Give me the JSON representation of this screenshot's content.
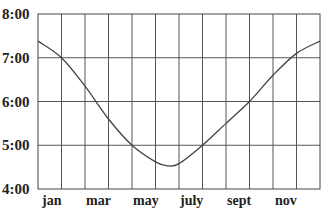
{
  "chart_data": {
    "type": "line",
    "title": "",
    "xlabel": "",
    "ylabel": "",
    "x_tick_labels": [
      "jan",
      "mar",
      "may",
      "july",
      "sept",
      "nov"
    ],
    "y_tick_labels": [
      "4:00",
      "5:00",
      "6:00",
      "7:00",
      "8:00"
    ],
    "ylim": [
      4.0,
      8.0
    ],
    "xlim": [
      0,
      12
    ],
    "grid": true,
    "legend": null,
    "series": [
      {
        "name": "time",
        "x": [
          0,
          1,
          2,
          3,
          4,
          5,
          5.5,
          6,
          7,
          8,
          9,
          10,
          11,
          12
        ],
        "y": [
          7.38,
          7.0,
          6.35,
          5.6,
          5.0,
          4.62,
          4.53,
          4.58,
          5.0,
          5.5,
          6.0,
          6.6,
          7.1,
          7.38
        ]
      }
    ]
  },
  "axis": {
    "y_labels": [
      "8:00",
      "7:00",
      "6:00",
      "5:00",
      "4:00"
    ],
    "x_labels": [
      "jan",
      "mar",
      "may",
      "july",
      "sept",
      "nov"
    ]
  }
}
